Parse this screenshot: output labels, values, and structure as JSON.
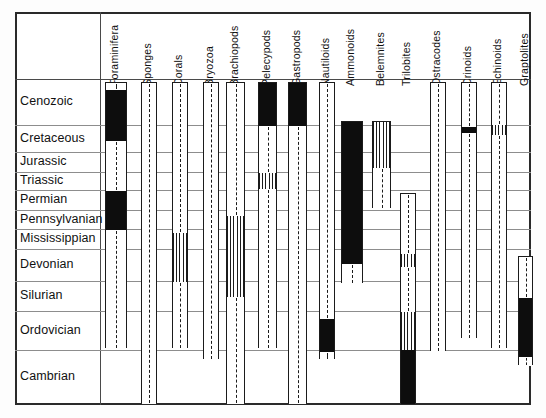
{
  "chart_data": {
    "type": "table",
    "xlabel": "Fossil groups",
    "ylabel": "Geologic period",
    "grid": true,
    "legend_position": "none",
    "categories": [
      "Foraminifera",
      "Sponges",
      "Corals",
      "Bryozoa",
      "Brachiopods",
      "Pelecypods",
      "Gastropods",
      "Nautiloids",
      "Ammonoids",
      "Belemnites",
      "Trilobites",
      "Ostracodes",
      "Crinoids",
      "Echinoids",
      "Graptolites"
    ],
    "periods": [
      {
        "name": "Cenozoic",
        "top": 79,
        "bottom": 125
      },
      {
        "name": "Cretaceous",
        "top": 125,
        "bottom": 152
      },
      {
        "name": "Jurassic",
        "top": 152,
        "bottom": 172
      },
      {
        "name": "Triassic",
        "top": 172,
        "bottom": 190
      },
      {
        "name": "Permian",
        "top": 190,
        "bottom": 210
      },
      {
        "name": "Pennsylvanian",
        "top": 210,
        "bottom": 229
      },
      {
        "name": "Mississippian",
        "top": 229,
        "bottom": 249
      },
      {
        "name": "Devonian",
        "top": 249,
        "bottom": 281
      },
      {
        "name": "Silurian",
        "top": 281,
        "bottom": 311
      },
      {
        "name": "Ordovician",
        "top": 311,
        "bottom": 350
      },
      {
        "name": "Cambrian",
        "top": 350,
        "bottom": 403
      }
    ],
    "colors": {
      "abundant": "#0d0d0d",
      "common": "#1b1b1b",
      "rare": "#ffffff",
      "frame": "#2a2a2a",
      "gridline": "#8d8d8d"
    },
    "ranges": [
      {
        "name": "Foraminifera",
        "x": 105,
        "w": 22,
        "top": 82,
        "bottom": 348,
        "segments": [
          {
            "style": "dash",
            "from": 82,
            "to": 89
          },
          {
            "style": "solid",
            "from": 89,
            "to": 140
          },
          {
            "style": "dash",
            "from": 140,
            "to": 190
          },
          {
            "style": "solid",
            "from": 190,
            "to": 229
          },
          {
            "style": "dash",
            "from": 229,
            "to": 348
          }
        ]
      },
      {
        "name": "Sponges",
        "x": 141,
        "w": 16,
        "top": 82,
        "bottom": 403,
        "segments": [
          {
            "style": "dash",
            "from": 82,
            "to": 403
          }
        ]
      },
      {
        "name": "Corals",
        "x": 172,
        "w": 16,
        "top": 82,
        "bottom": 348,
        "segments": [
          {
            "style": "dash",
            "from": 82,
            "to": 232
          },
          {
            "style": "hatch",
            "from": 232,
            "to": 281
          },
          {
            "style": "dash",
            "from": 281,
            "to": 348
          }
        ]
      },
      {
        "name": "Bryozoa",
        "x": 203,
        "w": 16,
        "top": 82,
        "bottom": 359,
        "segments": [
          {
            "style": "dash",
            "from": 82,
            "to": 359
          }
        ]
      },
      {
        "name": "Brachiopods",
        "x": 226,
        "w": 19,
        "top": 82,
        "bottom": 403,
        "segments": [
          {
            "style": "dash",
            "from": 82,
            "to": 215
          },
          {
            "style": "hatch",
            "from": 215,
            "to": 296
          },
          {
            "style": "dash",
            "from": 296,
            "to": 403
          }
        ]
      },
      {
        "name": "Pelecypods",
        "x": 258,
        "w": 19,
        "top": 82,
        "bottom": 348,
        "segments": [
          {
            "style": "solid",
            "from": 82,
            "to": 125
          },
          {
            "style": "dash",
            "from": 125,
            "to": 172
          },
          {
            "style": "hatch",
            "from": 172,
            "to": 188
          },
          {
            "style": "dash",
            "from": 188,
            "to": 348
          }
        ]
      },
      {
        "name": "Gastropods",
        "x": 288,
        "w": 19,
        "top": 82,
        "bottom": 403,
        "segments": [
          {
            "style": "solid",
            "from": 82,
            "to": 125
          },
          {
            "style": "dash",
            "from": 125,
            "to": 403
          }
        ]
      },
      {
        "name": "Nautiloids",
        "x": 319,
        "w": 16,
        "top": 82,
        "bottom": 359,
        "segments": [
          {
            "style": "dash",
            "from": 82,
            "to": 318
          },
          {
            "style": "solid",
            "from": 318,
            "to": 351
          },
          {
            "style": "dash",
            "from": 351,
            "to": 359
          }
        ]
      },
      {
        "name": "Ammonoids",
        "x": 341,
        "w": 22,
        "top": 121,
        "bottom": 283,
        "segments": [
          {
            "style": "solid",
            "from": 121,
            "to": 263
          },
          {
            "style": "dash",
            "from": 263,
            "to": 283
          }
        ]
      },
      {
        "name": "Belemnites",
        "x": 372,
        "w": 19,
        "top": 121,
        "bottom": 208,
        "segments": [
          {
            "style": "hatch",
            "from": 121,
            "to": 167
          },
          {
            "style": "dash",
            "from": 167,
            "to": 208
          }
        ]
      },
      {
        "name": "Trilobites",
        "x": 400,
        "w": 16,
        "top": 193,
        "bottom": 403,
        "segments": [
          {
            "style": "dash",
            "from": 193,
            "to": 253
          },
          {
            "style": "hatch",
            "from": 253,
            "to": 266
          },
          {
            "style": "dash",
            "from": 266,
            "to": 311
          },
          {
            "style": "hatch",
            "from": 311,
            "to": 349
          },
          {
            "style": "solid",
            "from": 349,
            "to": 403
          }
        ]
      },
      {
        "name": "Ostracodes",
        "x": 430,
        "w": 16,
        "top": 82,
        "bottom": 351,
        "segments": [
          {
            "style": "dash",
            "from": 82,
            "to": 351
          }
        ]
      },
      {
        "name": "Crinoids",
        "x": 461,
        "w": 16,
        "top": 82,
        "bottom": 338,
        "segments": [
          {
            "style": "dash",
            "from": 82,
            "to": 126
          },
          {
            "style": "solid",
            "from": 126,
            "to": 132
          },
          {
            "style": "dash",
            "from": 132,
            "to": 338
          }
        ]
      },
      {
        "name": "Echinoids",
        "x": 491,
        "w": 16,
        "top": 82,
        "bottom": 348,
        "segments": [
          {
            "style": "dash",
            "from": 82,
            "to": 124
          },
          {
            "style": "hatch",
            "from": 124,
            "to": 134
          },
          {
            "style": "dash",
            "from": 134,
            "to": 348
          }
        ]
      },
      {
        "name": "Graptolites",
        "x": 518,
        "w": 15,
        "top": 256,
        "bottom": 365,
        "segments": [
          {
            "style": "dash",
            "from": 256,
            "to": 297
          },
          {
            "style": "solid",
            "from": 297,
            "to": 356
          },
          {
            "style": "dash",
            "from": 356,
            "to": 365
          }
        ]
      }
    ]
  }
}
